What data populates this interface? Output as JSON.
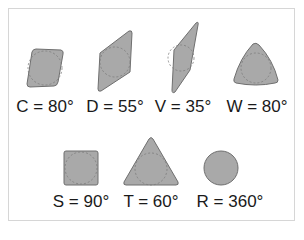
{
  "colors": {
    "fill": "#a9a9a9",
    "stroke": "#6f6f6f",
    "inscribed": "#7c7c7c",
    "border": "#d6d6d6",
    "text": "#1a1a1a"
  },
  "insert_shapes": [
    {
      "code": "C",
      "label": "C = 80°",
      "shape": "rhombic-80"
    },
    {
      "code": "D",
      "label": "D = 55°",
      "shape": "rhombic-55"
    },
    {
      "code": "V",
      "label": "V = 35°",
      "shape": "rhombic-35"
    },
    {
      "code": "W",
      "label": "W = 80°",
      "shape": "trigon-80"
    },
    {
      "code": "S",
      "label": "S = 90°",
      "shape": "square"
    },
    {
      "code": "T",
      "label": "T = 60°",
      "shape": "triangle"
    },
    {
      "code": "R",
      "label": "R = 360°",
      "shape": "round"
    }
  ]
}
